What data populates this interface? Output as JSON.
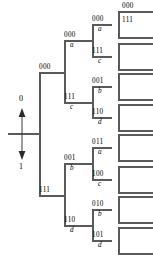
{
  "figure": {
    "type": "binary-tree-diagram",
    "title": "",
    "line_color": "#5a5a5a",
    "text_color": "#000000",
    "root": {
      "up_bit": "0",
      "down_bit": "1"
    },
    "levels": [
      {
        "depth": 1,
        "nodes": [
          {
            "code": "000",
            "letter": "",
            "x": 47,
            "y": 73
          },
          {
            "code": "111",
            "letter": "",
            "x": 47,
            "y": 196
          }
        ]
      },
      {
        "depth": 2,
        "nodes": [
          {
            "code": "000",
            "letter": "a",
            "x": 72,
            "y": 41
          },
          {
            "code": "111",
            "letter": "c",
            "x": 72,
            "y": 103
          },
          {
            "code": "001",
            "letter": "b",
            "x": 72,
            "y": 164
          },
          {
            "code": "110",
            "letter": "d",
            "x": 72,
            "y": 226
          }
        ]
      },
      {
        "depth": 3,
        "nodes": [
          {
            "code": "000",
            "letter": "a",
            "x": 100,
            "y": 25
          },
          {
            "code": "111",
            "letter": "c",
            "x": 100,
            "y": 57
          },
          {
            "code": "001",
            "letter": "b",
            "x": 100,
            "y": 87
          },
          {
            "code": "110",
            "letter": "d",
            "x": 100,
            "y": 118
          },
          {
            "code": "011",
            "letter": "a",
            "x": 100,
            "y": 148
          },
          {
            "code": "100",
            "letter": "c",
            "x": 100,
            "y": 180
          },
          {
            "code": "010",
            "letter": "b",
            "x": 100,
            "y": 210
          },
          {
            "code": "101",
            "letter": "d",
            "x": 100,
            "y": 241
          }
        ]
      }
    ],
    "leaf_labels": [
      {
        "code": "000",
        "x": 128,
        "y": 8
      },
      {
        "code": "111",
        "x": 128,
        "y": 22
      }
    ]
  }
}
